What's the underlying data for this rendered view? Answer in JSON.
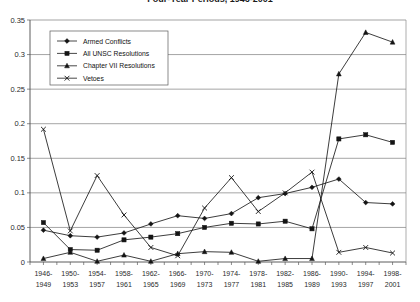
{
  "chart_data": {
    "type": "line",
    "title": "Four-Year Periods, 1946-2001",
    "xlabel": "",
    "ylabel": "",
    "ylim": [
      0,
      0.35
    ],
    "yticks": [
      "0",
      "0.05",
      "0.1",
      "0.15",
      "0.2",
      "0.25",
      "0.3",
      "0.35"
    ],
    "ytick_values": [
      0,
      0.05,
      0.1,
      0.15,
      0.2,
      0.25,
      0.3,
      0.35
    ],
    "grid": true,
    "legend_position": "upper-left-inside",
    "categories": [
      "1946-\n1949",
      "1950-\n1953",
      "1954-\n1957",
      "1958-\n1961",
      "1962-\n1965",
      "1966-\n1969",
      "1970-\n1973",
      "1974-\n1977",
      "1978-\n1981",
      "1982-\n1985",
      "1986-\n1989",
      "1990-\n1993",
      "1994-\n1997",
      "1998-\n2001"
    ],
    "categories_line1": [
      "1946-",
      "1950-",
      "1954-",
      "1958-",
      "1962-",
      "1966-",
      "1970-",
      "1974-",
      "1978-",
      "1982-",
      "1986-",
      "1990-",
      "1994-",
      "1998-"
    ],
    "categories_line2": [
      "1949",
      "1953",
      "1957",
      "1961",
      "1965",
      "1969",
      "1973",
      "1977",
      "1981",
      "1985",
      "1989",
      "1993",
      "1997",
      "2001"
    ],
    "series": [
      {
        "name": "Armed Conflicts",
        "marker": "diamond",
        "values": [
          0.046,
          0.038,
          0.036,
          0.042,
          0.055,
          0.067,
          0.063,
          0.07,
          0.093,
          0.099,
          0.108,
          0.12,
          0.086,
          0.084
        ]
      },
      {
        "name": "All UNSC Resolutions",
        "marker": "square",
        "values": [
          0.057,
          0.018,
          0.017,
          0.032,
          0.036,
          0.041,
          0.05,
          0.056,
          0.055,
          0.059,
          0.048,
          0.178,
          0.184,
          0.173
        ]
      },
      {
        "name": "Chapter VII Resolutions",
        "marker": "triangle",
        "values": [
          0.005,
          0.014,
          0.001,
          0.01,
          0.001,
          0.012,
          0.015,
          0.014,
          0.001,
          0.005,
          0.005,
          0.272,
          0.332,
          0.318
        ]
      },
      {
        "name": "Vetoes",
        "marker": "cross",
        "values": [
          0.192,
          0.045,
          0.125,
          0.068,
          0.021,
          0.009,
          0.078,
          0.122,
          0.073,
          0.1,
          0.13,
          0.014,
          0.021,
          0.013
        ]
      }
    ]
  },
  "legend": {
    "items": [
      {
        "label": "Armed  Conflicts",
        "marker": "diamond"
      },
      {
        "label": "All UNSC Resolutions",
        "marker": "square"
      },
      {
        "label": "Chapter VII Resolutions",
        "marker": "triangle"
      },
      {
        "label": "Vetoes",
        "marker": "cross"
      }
    ]
  },
  "colors": {
    "series": "#141414",
    "grid": "#7d7d7d",
    "axis": "#4a4a4a",
    "background": "#ffffff",
    "text": "#1a1a1a"
  }
}
